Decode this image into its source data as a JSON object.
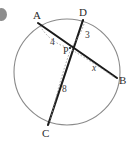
{
  "figure": {
    "type": "circle-intersecting-chords",
    "bullet_mark": "bullet-dot",
    "points": {
      "A": {
        "label": "A",
        "x": 38,
        "y": 23
      },
      "B": {
        "label": "B",
        "x": 117,
        "y": 78
      },
      "C": {
        "label": "C",
        "x": 48,
        "y": 125
      },
      "D": {
        "label": "D",
        "x": 83,
        "y": 20
      },
      "P": {
        "label": "P",
        "x": 70,
        "y": 48
      }
    },
    "segments": [
      {
        "name": "AP",
        "label": "4"
      },
      {
        "name": "DP",
        "label": "3"
      },
      {
        "name": "CP",
        "label": "8"
      },
      {
        "name": "PB",
        "label": "x"
      }
    ],
    "labels": {
      "A": "A",
      "B": "B",
      "C": "C",
      "D": "D",
      "P": "P",
      "seg_ap": "4",
      "seg_dp": "3",
      "seg_cp": "8",
      "seg_pb": "x"
    },
    "colors": {
      "circle_stroke": "#8a8a8a",
      "chord_stroke": "#1a1a1a",
      "dotted_stroke": "#9a9a9a",
      "text": "#2b2b2b",
      "bullet": "#8d8d8d",
      "background": "#ffffff"
    },
    "circle": {
      "cx": 67,
      "cy": 72,
      "r": 53
    }
  }
}
